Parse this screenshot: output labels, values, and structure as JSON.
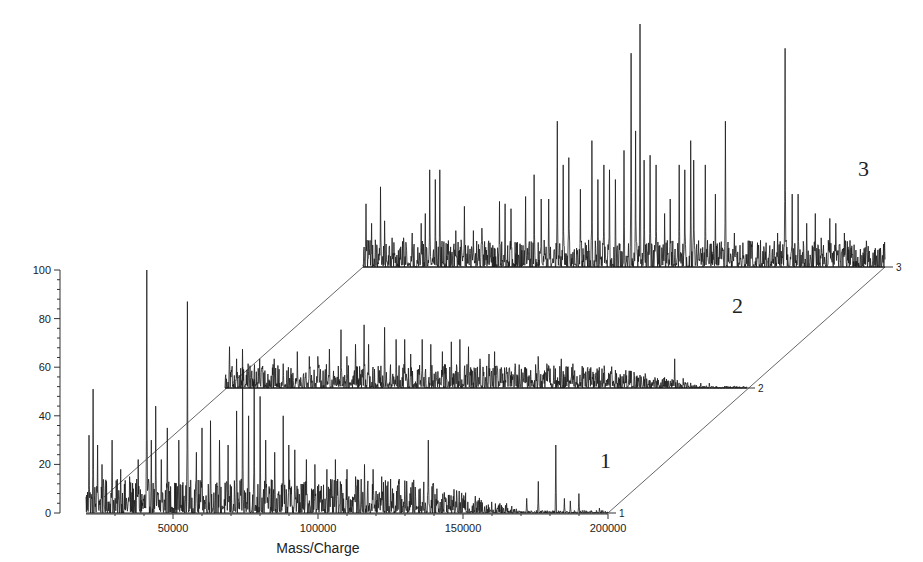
{
  "chart_data": {
    "type": "line",
    "subtype": "3d-stacked-waterfall-spectra",
    "title": "",
    "xlabel": "Mass/Charge",
    "ylabel": "",
    "xlim": [
      20000,
      200000
    ],
    "ylim": [
      0,
      100
    ],
    "x_ticks": [
      50000,
      100000,
      150000,
      200000
    ],
    "y_ticks": [
      0,
      20,
      40,
      60,
      80,
      100
    ],
    "depth_ticks": [
      "1",
      "2",
      "3"
    ],
    "grid": false,
    "legend": "none",
    "annotations": [
      {
        "text": "1",
        "series": 1
      },
      {
        "text": "2",
        "series": 2
      },
      {
        "text": "3",
        "series": 3
      }
    ],
    "series": [
      {
        "name": "1",
        "baseline_level": 0,
        "noise_level": 10,
        "noise_decay_start": 135000,
        "peaks": [
          [
            21000,
            32
          ],
          [
            22500,
            51
          ],
          [
            24000,
            28
          ],
          [
            25500,
            20
          ],
          [
            29000,
            30
          ],
          [
            32000,
            18
          ],
          [
            35000,
            15
          ],
          [
            38000,
            22
          ],
          [
            41000,
            100
          ],
          [
            42500,
            30
          ],
          [
            44000,
            44
          ],
          [
            46000,
            22
          ],
          [
            48000,
            35
          ],
          [
            52000,
            30
          ],
          [
            55000,
            87
          ],
          [
            58000,
            25
          ],
          [
            60000,
            35
          ],
          [
            63000,
            38
          ],
          [
            66000,
            30
          ],
          [
            69000,
            28
          ],
          [
            72000,
            42
          ],
          [
            74000,
            60
          ],
          [
            76000,
            40
          ],
          [
            78000,
            55
          ],
          [
            80000,
            48
          ],
          [
            82000,
            30
          ],
          [
            85000,
            25
          ],
          [
            88000,
            40
          ],
          [
            90000,
            28
          ],
          [
            92000,
            26
          ],
          [
            96000,
            22
          ],
          [
            99000,
            20
          ],
          [
            103000,
            18
          ],
          [
            106000,
            22
          ],
          [
            110000,
            18
          ],
          [
            113000,
            15
          ],
          [
            116000,
            20
          ],
          [
            119000,
            18
          ],
          [
            122000,
            15
          ],
          [
            125000,
            14
          ],
          [
            128000,
            14
          ],
          [
            132000,
            8
          ],
          [
            138000,
            30
          ],
          [
            141000,
            10
          ],
          [
            150000,
            6
          ],
          [
            165000,
            4
          ],
          [
            172000,
            6
          ],
          [
            176000,
            13
          ],
          [
            182000,
            28
          ],
          [
            185000,
            6
          ],
          [
            187000,
            5
          ],
          [
            190000,
            8
          ],
          [
            197000,
            2
          ]
        ]
      },
      {
        "name": "2",
        "baseline_level": 50,
        "noise_level": 7,
        "noise_decay_start": 150000,
        "peaks": [
          [
            21500,
            17
          ],
          [
            24000,
            12
          ],
          [
            26000,
            16
          ],
          [
            28000,
            10
          ],
          [
            32000,
            12
          ],
          [
            37000,
            12
          ],
          [
            40000,
            10
          ],
          [
            45000,
            15
          ],
          [
            49000,
            13
          ],
          [
            52000,
            13
          ],
          [
            56000,
            16
          ],
          [
            60000,
            24
          ],
          [
            62000,
            13
          ],
          [
            65000,
            18
          ],
          [
            68000,
            26
          ],
          [
            69500,
            18
          ],
          [
            75000,
            25
          ],
          [
            79000,
            20
          ],
          [
            82000,
            20
          ],
          [
            84000,
            14
          ],
          [
            88000,
            20
          ],
          [
            91000,
            18
          ],
          [
            95000,
            15
          ],
          [
            98000,
            19
          ],
          [
            101000,
            20
          ],
          [
            104000,
            17
          ],
          [
            108000,
            12
          ],
          [
            111000,
            14
          ],
          [
            113000,
            15
          ],
          [
            120000,
            10
          ],
          [
            124000,
            8
          ],
          [
            128000,
            13
          ],
          [
            131000,
            10
          ],
          [
            136000,
            12
          ],
          [
            140000,
            10
          ],
          [
            145000,
            8
          ],
          [
            150000,
            8
          ],
          [
            155000,
            6
          ],
          [
            160000,
            7
          ],
          [
            165000,
            5
          ],
          [
            175000,
            12
          ],
          [
            178000,
            4
          ],
          [
            184000,
            2
          ],
          [
            187000,
            2
          ]
        ]
      },
      {
        "name": "3",
        "baseline_level": 100,
        "noise_level": 8,
        "noise_decay_start": 210000,
        "peaks": [
          [
            21000,
            26
          ],
          [
            23000,
            18
          ],
          [
            26000,
            33
          ],
          [
            27500,
            19
          ],
          [
            30000,
            12
          ],
          [
            34000,
            12
          ],
          [
            37000,
            14
          ],
          [
            40000,
            18
          ],
          [
            41500,
            22
          ],
          [
            43000,
            40
          ],
          [
            45000,
            36
          ],
          [
            46500,
            40
          ],
          [
            52000,
            15
          ],
          [
            55000,
            25
          ],
          [
            58000,
            15
          ],
          [
            61000,
            16
          ],
          [
            67000,
            27
          ],
          [
            69000,
            26
          ],
          [
            71000,
            24
          ],
          [
            76000,
            29
          ],
          [
            79000,
            38
          ],
          [
            81500,
            28
          ],
          [
            84000,
            28
          ],
          [
            87000,
            60
          ],
          [
            89000,
            42
          ],
          [
            91000,
            45
          ],
          [
            95000,
            32
          ],
          [
            99000,
            52
          ],
          [
            101000,
            36
          ],
          [
            103000,
            42
          ],
          [
            105000,
            40
          ],
          [
            107000,
            36
          ],
          [
            110000,
            48
          ],
          [
            112500,
            88
          ],
          [
            114000,
            56
          ],
          [
            115500,
            100
          ],
          [
            117000,
            44
          ],
          [
            119000,
            46
          ],
          [
            121000,
            42
          ],
          [
            124000,
            22
          ],
          [
            126000,
            28
          ],
          [
            129000,
            42
          ],
          [
            131000,
            40
          ],
          [
            133000,
            52
          ],
          [
            134000,
            44
          ],
          [
            138000,
            42
          ],
          [
            141500,
            30
          ],
          [
            145000,
            60
          ],
          [
            148000,
            14
          ],
          [
            151000,
            10
          ],
          [
            156000,
            10
          ],
          [
            159000,
            10
          ],
          [
            163000,
            14
          ],
          [
            165500,
            90
          ],
          [
            168000,
            30
          ],
          [
            170000,
            30
          ],
          [
            173000,
            18
          ],
          [
            176000,
            22
          ],
          [
            178000,
            12
          ],
          [
            181000,
            20
          ],
          [
            183000,
            18
          ],
          [
            186000,
            14
          ]
        ]
      }
    ]
  },
  "layout": {
    "line_color": "#1a1a1a",
    "axis_color": "#333333"
  }
}
